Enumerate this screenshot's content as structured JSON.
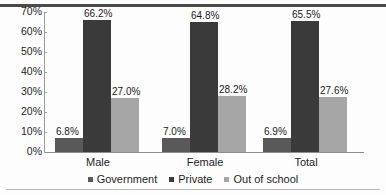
{
  "chart_data": {
    "type": "bar",
    "title": "",
    "subtitle": "",
    "xlabel": "",
    "ylabel": "",
    "categories": [
      "Male",
      "Female",
      "Total"
    ],
    "series": [
      {
        "name": "Government",
        "values": [
          6.8,
          7.0,
          6.9
        ],
        "color": "#595959"
      },
      {
        "name": "Private",
        "values": [
          66.2,
          64.8,
          65.5
        ],
        "color": "#3a3a3a"
      },
      {
        "name": "Out of school",
        "values": [
          27.0,
          28.2,
          27.6
        ],
        "color": "#a6a6a6"
      }
    ],
    "data_labels": [
      [
        "6.8%",
        "7.0%",
        "6.9%"
      ],
      [
        "66.2%",
        "64.8%",
        "65.5%"
      ],
      [
        "27.0%",
        "28.2%",
        "27.6%"
      ]
    ],
    "ylim": [
      0,
      70
    ],
    "ytick_values": [
      0,
      10,
      20,
      30,
      40,
      50,
      60,
      70
    ],
    "ytick_labels": [
      "0%",
      "10%",
      "20%",
      "30%",
      "40%",
      "50%",
      "60%",
      "70%"
    ],
    "grid": false,
    "legend_position": "bottom",
    "value_suffix": "%"
  },
  "axis": {
    "y_labels": [
      "70%",
      "60%",
      "50%",
      "40%",
      "30%",
      "20%",
      "10%",
      "0%"
    ]
  },
  "legend": {
    "items": [
      {
        "label": "Government",
        "color": "#595959"
      },
      {
        "label": "Private",
        "color": "#3a3a3a"
      },
      {
        "label": "Out of school",
        "color": "#a6a6a6"
      }
    ]
  },
  "colors": {
    "government": "#595959",
    "private": "#3a3a3a",
    "out_of_school": "#a6a6a6",
    "axis": "#8d8d8d",
    "text": "#1d1d1d",
    "rule_top": "#4a4a4a",
    "rule_bottom": "#b9b9b9",
    "background": "#fdfdfd"
  }
}
